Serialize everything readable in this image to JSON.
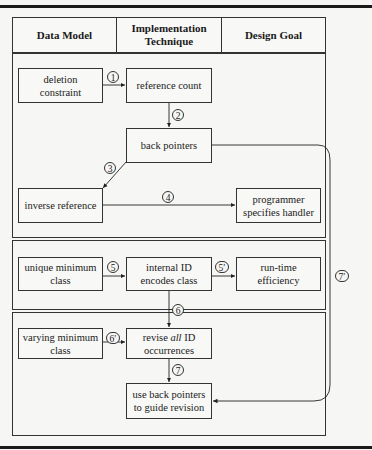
{
  "header": {
    "columns": [
      "Data Model",
      "Implementation Technique",
      "Design Goal"
    ],
    "col1": "Data Model",
    "col2_line1": "Implementation",
    "col2_line2": "Technique",
    "col3": "Design Goal"
  },
  "boxes": {
    "deletion_constraint": [
      "deletion",
      "constraint"
    ],
    "reference_count": "reference count",
    "back_pointers": "back pointers",
    "inverse_reference": "inverse reference",
    "programmer_handler": [
      "programmer",
      "specifies handler"
    ],
    "unique_minimum_class": [
      "unique minimum",
      "class"
    ],
    "internal_id": [
      "internal ID",
      "encodes class"
    ],
    "runtime_efficiency": [
      "run-time",
      "efficiency"
    ],
    "varying_minimum_class": [
      "varying minimum",
      "class"
    ],
    "revise_all": {
      "pre": "revise ",
      "em": "all",
      "post": " ID",
      "line2": "occurrences"
    },
    "use_back_pointers": [
      "use back pointers",
      "to guide revision"
    ]
  },
  "edge_labels": {
    "e1": "1",
    "e2": "2",
    "e3": "3",
    "e4": "4",
    "e5": "5",
    "e5p": "5′",
    "e6": "6",
    "e6p": "6′",
    "e7": "7",
    "e7p": "7′"
  },
  "edges": [
    {
      "from": "deletion constraint",
      "to": "reference count",
      "label": "1"
    },
    {
      "from": "reference count",
      "to": "back pointers",
      "label": "2"
    },
    {
      "from": "back pointers",
      "to": "inverse reference",
      "label": "3"
    },
    {
      "from": "inverse reference",
      "to": "programmer specifies handler",
      "label": "4"
    },
    {
      "from": "unique minimum class",
      "to": "internal ID encodes class",
      "label": "5"
    },
    {
      "from": "internal ID encodes class",
      "to": "run-time efficiency",
      "label": "5′"
    },
    {
      "from": "internal ID encodes class",
      "to": "revise all ID occurrences",
      "label": "6"
    },
    {
      "from": "varying minimum class",
      "to": "revise all ID occurrences",
      "label": "6′"
    },
    {
      "from": "revise all ID occurrences",
      "to": "use back pointers to guide revision",
      "label": "7"
    },
    {
      "from": "back pointers",
      "to": "use back pointers to guide revision",
      "label": "7′"
    }
  ]
}
